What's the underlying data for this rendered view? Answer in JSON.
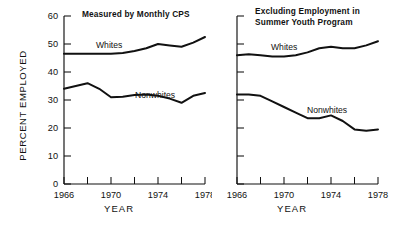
{
  "figure": {
    "ylabel": "PERCENT EMPLOYED",
    "xlabel_left": "YEAR",
    "xlabel_right": "YEAR"
  },
  "chart_data": [
    {
      "type": "line",
      "title": "Measured by Monthly CPS",
      "xlabel": "YEAR",
      "ylabel": "PERCENT EMPLOYED",
      "xlim": [
        1966,
        1978
      ],
      "ylim": [
        0,
        60
      ],
      "ytick_labels": [
        "0",
        "10",
        "20",
        "30",
        "40",
        "50",
        "60"
      ],
      "yticks": [
        0,
        10,
        20,
        30,
        40,
        50,
        60
      ],
      "xtick_labels": [
        "1966",
        "1970",
        "1974",
        "1978"
      ],
      "xticks": [
        1966,
        1968,
        1970,
        1972,
        1974,
        1976,
        1978
      ],
      "grid": false,
      "legend": "inline-annotations",
      "x": [
        1966,
        1967,
        1968,
        1969,
        1970,
        1971,
        1972,
        1973,
        1974,
        1975,
        1976,
        1977,
        1978
      ],
      "series": [
        {
          "name": "Whites",
          "values": [
            46.5,
            46.5,
            46.5,
            46.5,
            46.5,
            46.8,
            47.5,
            48.5,
            50.0,
            49.5,
            49.0,
            50.5,
            52.5
          ]
        },
        {
          "name": "Nonwhites",
          "values": [
            34.0,
            35.0,
            36.0,
            34.0,
            31.0,
            31.2,
            31.8,
            32.0,
            31.5,
            30.5,
            29.0,
            31.5,
            32.5
          ]
        }
      ]
    },
    {
      "type": "line",
      "title": "Excluding Employment in Summer Youth Program",
      "title_line1": "Excluding Employment in",
      "title_line2": "Summer Youth Program",
      "xlabel": "YEAR",
      "ylabel": "PERCENT EMPLOYED",
      "xlim": [
        1966,
        1978
      ],
      "ylim": [
        0,
        60
      ],
      "yticks": [
        0,
        10,
        20,
        30,
        40,
        50,
        60
      ],
      "xtick_labels": [
        "1966",
        "1970",
        "1974",
        "1978"
      ],
      "xticks": [
        1966,
        1968,
        1970,
        1972,
        1974,
        1976,
        1978
      ],
      "grid": false,
      "legend": "inline-annotations",
      "x": [
        1966,
        1967,
        1968,
        1969,
        1970,
        1971,
        1972,
        1973,
        1974,
        1975,
        1976,
        1977,
        1978
      ],
      "series": [
        {
          "name": "Whites",
          "values": [
            46.0,
            46.3,
            46.0,
            45.5,
            45.5,
            46.0,
            47.0,
            48.5,
            49.0,
            48.5,
            48.5,
            49.5,
            51.0
          ]
        },
        {
          "name": "Nonwhites",
          "values": [
            32.0,
            32.0,
            31.5,
            29.5,
            27.5,
            25.5,
            23.5,
            23.5,
            24.5,
            22.5,
            19.5,
            19.0,
            19.5
          ]
        }
      ]
    }
  ],
  "annotations": {
    "left_whites": "Whites",
    "left_nonwhites": "Nonwhites",
    "right_whites": "Whites",
    "right_nonwhites": "Nonwhites"
  }
}
